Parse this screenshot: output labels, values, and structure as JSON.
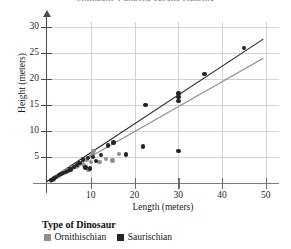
{
  "chart_data": {
    "type": "scatter",
    "title": "Dinosaur Lengths versus Heights",
    "xlabel": "Length (meters)",
    "ylabel": "Height (meters)",
    "xlim": [
      0,
      53
    ],
    "ylim": [
      0,
      31
    ],
    "xticks": [
      10,
      20,
      30,
      40,
      50
    ],
    "yticks": [
      5,
      10,
      15,
      20,
      25,
      30
    ],
    "grid": true,
    "legend_position": "below",
    "legend_title": "Type of Dinosaur",
    "series": [
      {
        "name": "Ornithischian",
        "color": "#8f8f8f",
        "marker": "circle",
        "points": [
          [
            0.9,
            0.5
          ],
          [
            1.3,
            0.7
          ],
          [
            1.8,
            1.0
          ],
          [
            2.2,
            1.2
          ],
          [
            2.6,
            1.4
          ],
          [
            3.0,
            1.6
          ],
          [
            3.4,
            1.8
          ],
          [
            3.8,
            2.0
          ],
          [
            4.2,
            2.2
          ],
          [
            4.6,
            2.4
          ],
          [
            5.0,
            2.5
          ],
          [
            5.5,
            2.8
          ],
          [
            6.0,
            3.0
          ],
          [
            6.5,
            3.2
          ],
          [
            7.0,
            3.4
          ],
          [
            7.5,
            3.6
          ],
          [
            8.0,
            3.8
          ],
          [
            8.5,
            3.4
          ],
          [
            9.0,
            4.4
          ],
          [
            9.5,
            2.6
          ],
          [
            10.0,
            4.0
          ],
          [
            10.2,
            5.2
          ],
          [
            10.4,
            5.6
          ],
          [
            10.6,
            6.2
          ],
          [
            12.0,
            4.0
          ],
          [
            13.5,
            4.6
          ],
          [
            15.0,
            4.3
          ],
          [
            16.5,
            5.6
          ]
        ],
        "fit_line": {
          "slope": 0.48,
          "intercept": 0.3
        }
      },
      {
        "name": "Saurischian",
        "color": "#242424",
        "marker": "circle",
        "points": [
          [
            1.0,
            0.6
          ],
          [
            1.6,
            0.9
          ],
          [
            2.1,
            1.1
          ],
          [
            2.7,
            1.5
          ],
          [
            3.2,
            1.7
          ],
          [
            3.7,
            1.9
          ],
          [
            4.3,
            2.1
          ],
          [
            4.8,
            2.3
          ],
          [
            5.4,
            2.6
          ],
          [
            6.1,
            3.1
          ],
          [
            6.8,
            3.5
          ],
          [
            7.4,
            3.8
          ],
          [
            8.2,
            4.5
          ],
          [
            8.8,
            3.0
          ],
          [
            9.3,
            4.8
          ],
          [
            9.8,
            2.8
          ],
          [
            10.5,
            5.0
          ],
          [
            11.2,
            4.2
          ],
          [
            12.4,
            5.4
          ],
          [
            14.0,
            7.2
          ],
          [
            15.2,
            7.8
          ],
          [
            18.0,
            5.5
          ],
          [
            22.0,
            7.0
          ],
          [
            22.5,
            15.0
          ],
          [
            30.0,
            6.2
          ],
          [
            30.0,
            15.8
          ],
          [
            30.0,
            16.6
          ],
          [
            30.0,
            17.2
          ],
          [
            36.0,
            21.0
          ],
          [
            45.0,
            26.0
          ]
        ],
        "fit_line": {
          "slope": 0.555,
          "intercept": 0.4
        }
      }
    ]
  },
  "axis": {
    "y_labels": [
      "30",
      "25",
      "20",
      "15",
      "10",
      "5"
    ],
    "x_labels": [
      "10",
      "20",
      "30",
      "40",
      "50"
    ],
    "y_title": "Height (meters)",
    "x_title": "Length (meters)"
  },
  "legend": {
    "title": "Type of Dinosaur",
    "entries": [
      {
        "label": "Ornithischian",
        "color": "#8f8f8f"
      },
      {
        "label": "Saurischian",
        "color": "#242424"
      }
    ]
  }
}
